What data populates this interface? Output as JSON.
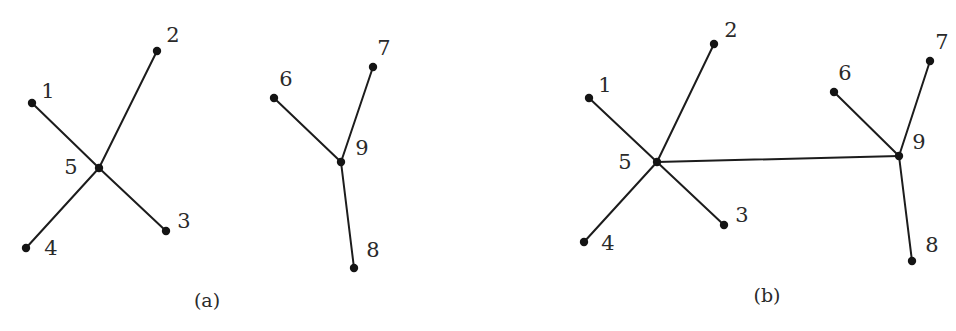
{
  "figure": {
    "panels": [
      {
        "id": "a",
        "caption": "(a)",
        "caption_pos": [
          207,
          300
        ],
        "nodes": [
          {
            "id": "1",
            "label": "1",
            "x": 32,
            "y": 103,
            "lx": 48,
            "ly": 91
          },
          {
            "id": "2",
            "label": "2",
            "x": 157,
            "y": 51,
            "lx": 173,
            "ly": 35
          },
          {
            "id": "3",
            "label": "3",
            "x": 166,
            "y": 231,
            "lx": 184,
            "ly": 221
          },
          {
            "id": "4",
            "label": "4",
            "x": 26,
            "y": 248,
            "lx": 51,
            "ly": 248
          },
          {
            "id": "5",
            "label": "5",
            "x": 99,
            "y": 168,
            "lx": 71,
            "ly": 167
          },
          {
            "id": "6",
            "label": "6",
            "x": 274,
            "y": 98,
            "lx": 286,
            "ly": 79
          },
          {
            "id": "7",
            "label": "7",
            "x": 373,
            "y": 67,
            "lx": 384,
            "ly": 48
          },
          {
            "id": "8",
            "label": "8",
            "x": 354,
            "y": 268,
            "lx": 373,
            "ly": 250
          },
          {
            "id": "9",
            "label": "9",
            "x": 341,
            "y": 162,
            "lx": 362,
            "ly": 148
          }
        ],
        "edges": [
          [
            "1",
            "5"
          ],
          [
            "2",
            "5"
          ],
          [
            "3",
            "5"
          ],
          [
            "4",
            "5"
          ],
          [
            "6",
            "9"
          ],
          [
            "7",
            "9"
          ],
          [
            "8",
            "9"
          ]
        ]
      },
      {
        "id": "b",
        "caption": "(b)",
        "caption_pos": [
          767,
          295
        ],
        "nodes": [
          {
            "id": "1",
            "label": "1",
            "x": 589,
            "y": 98,
            "lx": 605,
            "ly": 85
          },
          {
            "id": "2",
            "label": "2",
            "x": 714,
            "y": 44,
            "lx": 731,
            "ly": 30
          },
          {
            "id": "3",
            "label": "3",
            "x": 724,
            "y": 225,
            "lx": 742,
            "ly": 215
          },
          {
            "id": "4",
            "label": "4",
            "x": 584,
            "y": 242,
            "lx": 608,
            "ly": 243
          },
          {
            "id": "5",
            "label": "5",
            "x": 657,
            "y": 162,
            "lx": 625,
            "ly": 162
          },
          {
            "id": "6",
            "label": "6",
            "x": 834,
            "y": 92,
            "lx": 845,
            "ly": 73
          },
          {
            "id": "7",
            "label": "7",
            "x": 930,
            "y": 61,
            "lx": 942,
            "ly": 42
          },
          {
            "id": "8",
            "label": "8",
            "x": 912,
            "y": 261,
            "lx": 932,
            "ly": 245
          },
          {
            "id": "9",
            "label": "9",
            "x": 899,
            "y": 156,
            "lx": 919,
            "ly": 142
          }
        ],
        "edges": [
          [
            "1",
            "5"
          ],
          [
            "2",
            "5"
          ],
          [
            "3",
            "5"
          ],
          [
            "4",
            "5"
          ],
          [
            "5",
            "9"
          ],
          [
            "6",
            "9"
          ],
          [
            "7",
            "9"
          ],
          [
            "8",
            "9"
          ]
        ]
      }
    ],
    "colors": {
      "edge": "#1c1c1c",
      "node": "#141414",
      "text": "#2a2a2a",
      "background": "#ffffff"
    }
  }
}
